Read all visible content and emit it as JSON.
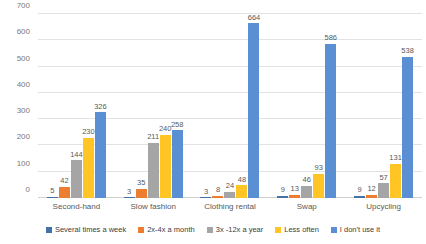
{
  "chart_data": {
    "type": "bar",
    "title": "",
    "subtitle": "",
    "xlabel": "",
    "ylabel": "",
    "ylim": [
      0,
      700
    ],
    "y_ticks": [
      0,
      100,
      200,
      300,
      400,
      500,
      600,
      700
    ],
    "grid": true,
    "legend_position": "bottom",
    "categories": [
      "Second-hand",
      "Slow fashion",
      "Clothing rental",
      "Swap",
      "Upcycling"
    ],
    "series": [
      {
        "name": "Several times a week",
        "color": "#4472a8",
        "values": [
          5,
          3,
          3,
          9,
          9
        ]
      },
      {
        "name": "2x-4x a month",
        "color": "#ed7d31",
        "values": [
          42,
          35,
          8,
          13,
          12
        ]
      },
      {
        "name": "3x -12x a year",
        "color": "#a5a5a5",
        "values": [
          144,
          211,
          24,
          46,
          57
        ]
      },
      {
        "name": "Less often",
        "color": "#ffc524",
        "values": [
          230,
          240,
          48,
          93,
          131
        ]
      },
      {
        "name": "I don't use it",
        "color": "#5b8fd4",
        "values": [
          326,
          258,
          664,
          586,
          538
        ]
      }
    ]
  },
  "colors": {
    "gridline": "#e3e3e3",
    "axis_text": "#7a7a7a",
    "label_text": "#595959",
    "background": "#ffffff"
  }
}
